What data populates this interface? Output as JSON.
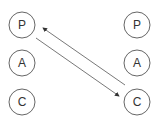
{
  "diagram": {
    "left_column": {
      "nodes": [
        {
          "label": "P",
          "cx": 22,
          "cy": 25
        },
        {
          "label": "A",
          "cx": 22,
          "cy": 63
        },
        {
          "label": "C",
          "cx": 22,
          "cy": 102
        }
      ]
    },
    "right_column": {
      "nodes": [
        {
          "label": "P",
          "cx": 137,
          "cy": 25
        },
        {
          "label": "A",
          "cx": 137,
          "cy": 63
        },
        {
          "label": "C",
          "cx": 137,
          "cy": 102
        }
      ]
    },
    "edges": [
      {
        "from": "left.P",
        "to": "right.C",
        "direction": "forward"
      },
      {
        "from": "right.C",
        "to": "left.P",
        "direction": "forward"
      }
    ],
    "colors": {
      "stroke": "#555555",
      "text": "#333333",
      "background": "#ffffff"
    }
  }
}
